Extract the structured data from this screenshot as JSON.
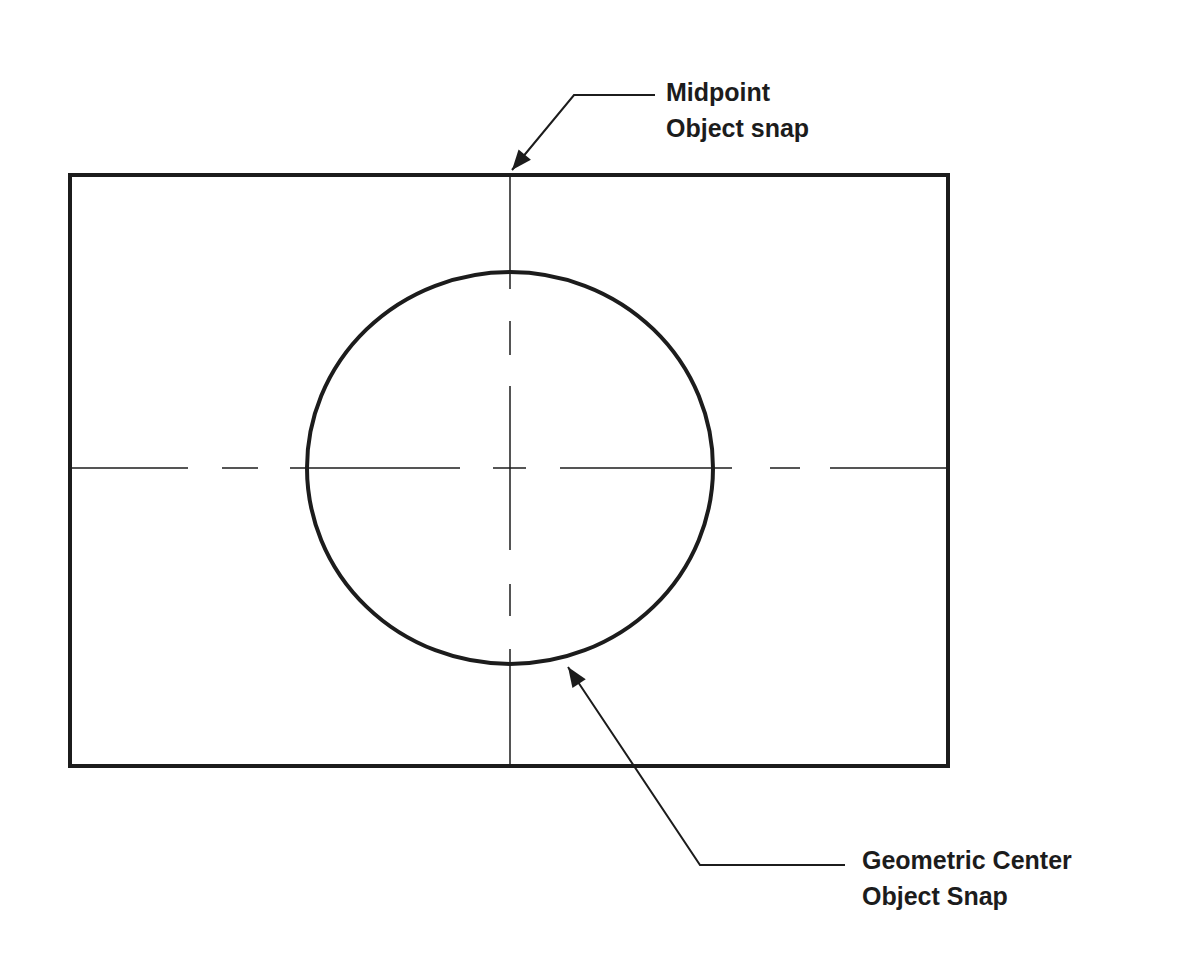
{
  "diagram": {
    "title": "",
    "colors": {
      "stroke": "#1c1c1c",
      "background": "#ffffff"
    },
    "rectangle": {
      "x": 70,
      "y": 175,
      "width": 878,
      "height": 591,
      "stroke_width": 4
    },
    "circle": {
      "cx": 510,
      "cy": 468,
      "rx": 203,
      "ry": 196,
      "stroke_width": 4
    },
    "centerlines": {
      "vertical": {
        "x": 510,
        "segments": [
          [
            175,
            289
          ],
          [
            321,
            355
          ],
          [
            386,
            550
          ],
          [
            584,
            616
          ],
          [
            649,
            766
          ]
        ]
      },
      "horizontal": {
        "y": 468,
        "segments": [
          [
            72,
            188
          ],
          [
            222,
            258
          ],
          [
            290,
            460
          ],
          [
            493,
            526
          ],
          [
            560,
            732
          ],
          [
            770,
            800
          ],
          [
            830,
            946
          ]
        ]
      }
    },
    "callouts": [
      {
        "id": "midpoint",
        "line1": "Midpoint",
        "line2": "Object snap",
        "label_pos": {
          "x": 666,
          "y": 74
        },
        "leader": [
          [
            655,
            95
          ],
          [
            574,
            95
          ],
          [
            512,
            170
          ]
        ],
        "arrow_tip": [
          512,
          170
        ]
      },
      {
        "id": "geometric-center",
        "line1": "Geometric Center",
        "line2": "Object Snap",
        "label_pos": {
          "x": 862,
          "y": 842
        },
        "leader": [
          [
            845,
            865
          ],
          [
            700,
            865
          ],
          [
            568,
            667
          ]
        ],
        "arrow_tip": [
          568,
          667
        ]
      }
    ]
  }
}
